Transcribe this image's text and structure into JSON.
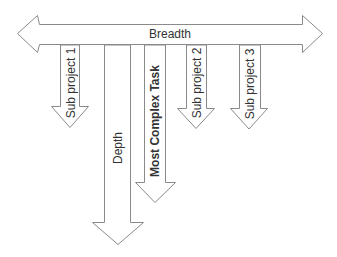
{
  "diagram": {
    "type": "work-breakdown-arrows",
    "horizontal_arrow": {
      "label": "Breadth",
      "direction": "bidirectional"
    },
    "vertical_arrows": [
      {
        "id": "sub1",
        "label": "Sub project 1",
        "bold": false
      },
      {
        "id": "depth",
        "label": "Depth",
        "bold": false
      },
      {
        "id": "most-complex",
        "label": "Most Complex Task",
        "bold": true
      },
      {
        "id": "sub2",
        "label": "Sub project 2",
        "bold": false
      },
      {
        "id": "sub3",
        "label": "Sub project 3",
        "bold": false
      }
    ]
  },
  "colors": {
    "stroke": "#8a8a8a",
    "fill": "#ffffff",
    "text": "#333333"
  }
}
